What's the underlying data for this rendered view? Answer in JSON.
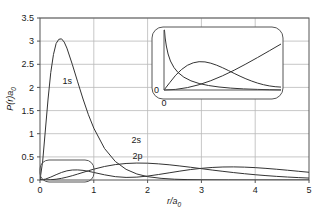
{
  "chart_data": {
    "type": "line",
    "title": "",
    "subtitle": "",
    "xlabel": "r/a",
    "xlabel_sub": "0",
    "ylabel": "P(r)a",
    "ylabel_sub": "0",
    "xlim": [
      0,
      5
    ],
    "ylim": [
      0,
      3.5
    ],
    "grid": true,
    "legend_position": "inline-annotations",
    "xticks": [
      "0",
      "1",
      "2",
      "3",
      "4",
      "5"
    ],
    "xtick_values": [
      0,
      1,
      2,
      3,
      4,
      5
    ],
    "yticks": [
      "0",
      "0.5",
      "1",
      "1.5",
      "2",
      "2.5",
      "3",
      "3.5"
    ],
    "ytick_values": [
      0,
      0.5,
      1,
      1.5,
      2,
      2.5,
      3,
      3.5
    ],
    "series": [
      {
        "name": "1s",
        "label": "1s",
        "label_x": 0.42,
        "label_y": 2.08,
        "peak_x": 0.4,
        "peak_y": 3.05,
        "points": [
          [
            0.0,
            0.0
          ],
          [
            0.05,
            0.41
          ],
          [
            0.1,
            1.08
          ],
          [
            0.15,
            1.75
          ],
          [
            0.2,
            2.32
          ],
          [
            0.25,
            2.71
          ],
          [
            0.3,
            2.95
          ],
          [
            0.35,
            3.04
          ],
          [
            0.4,
            3.05
          ],
          [
            0.45,
            2.98
          ],
          [
            0.5,
            2.85
          ],
          [
            0.6,
            2.5
          ],
          [
            0.7,
            2.12
          ],
          [
            0.8,
            1.75
          ],
          [
            0.9,
            1.41
          ],
          [
            1.0,
            1.12
          ],
          [
            1.2,
            0.68
          ],
          [
            1.4,
            0.4
          ],
          [
            1.6,
            0.23
          ],
          [
            1.8,
            0.13
          ],
          [
            2.0,
            0.072
          ],
          [
            2.25,
            0.036
          ],
          [
            2.5,
            0.017
          ],
          [
            2.75,
            0.008
          ],
          [
            3.0,
            0.004
          ],
          [
            3.5,
            0.0008
          ],
          [
            4.0,
            0.0001
          ],
          [
            5.0,
            0.0
          ]
        ]
      },
      {
        "name": "2s",
        "label": "2s",
        "label_x": 1.7,
        "label_y": 0.8,
        "peak_x": 2.05,
        "peak_y": 0.62,
        "points": [
          [
            0.0,
            0.0
          ],
          [
            0.1,
            0.019
          ],
          [
            0.2,
            0.063
          ],
          [
            0.3,
            0.115
          ],
          [
            0.4,
            0.163
          ],
          [
            0.5,
            0.198
          ],
          [
            0.6,
            0.216
          ],
          [
            0.7,
            0.218
          ],
          [
            0.8,
            0.208
          ],
          [
            0.9,
            0.188
          ],
          [
            1.0,
            0.163
          ],
          [
            1.2,
            0.112
          ],
          [
            1.4,
            0.072
          ],
          [
            1.6,
            0.056
          ],
          [
            1.8,
            0.062
          ],
          [
            2.0,
            0.085
          ],
          [
            2.2,
            0.118
          ],
          [
            2.4,
            0.155
          ],
          [
            2.6,
            0.192
          ],
          [
            2.8,
            0.226
          ],
          [
            3.0,
            0.252
          ],
          [
            3.2,
            0.271
          ],
          [
            3.4,
            0.281
          ],
          [
            3.6,
            0.283
          ],
          [
            3.8,
            0.278
          ],
          [
            4.0,
            0.267
          ],
          [
            4.2,
            0.251
          ],
          [
            4.4,
            0.232
          ],
          [
            4.6,
            0.211
          ],
          [
            4.8,
            0.189
          ],
          [
            5.0,
            0.167
          ]
        ]
      },
      {
        "name": "2p",
        "label": "2p",
        "label_x": 1.72,
        "label_y": 0.46,
        "peak_x": 1.95,
        "peak_y": 0.55,
        "points": [
          [
            0.0,
            0.0
          ],
          [
            0.1,
            0.0008
          ],
          [
            0.2,
            0.0056
          ],
          [
            0.3,
            0.017
          ],
          [
            0.4,
            0.036
          ],
          [
            0.5,
            0.062
          ],
          [
            0.6,
            0.093
          ],
          [
            0.7,
            0.128
          ],
          [
            0.8,
            0.164
          ],
          [
            0.9,
            0.2
          ],
          [
            1.0,
            0.234
          ],
          [
            1.2,
            0.292
          ],
          [
            1.4,
            0.333
          ],
          [
            1.6,
            0.357
          ],
          [
            1.8,
            0.366
          ],
          [
            2.0,
            0.363
          ],
          [
            2.2,
            0.349
          ],
          [
            2.4,
            0.329
          ],
          [
            2.6,
            0.303
          ],
          [
            2.8,
            0.275
          ],
          [
            3.0,
            0.245
          ],
          [
            3.2,
            0.215
          ],
          [
            3.4,
            0.187
          ],
          [
            3.6,
            0.16
          ],
          [
            3.8,
            0.136
          ],
          [
            4.0,
            0.114
          ],
          [
            4.2,
            0.095
          ],
          [
            4.4,
            0.078
          ],
          [
            4.6,
            0.064
          ],
          [
            4.8,
            0.052
          ],
          [
            5.0,
            0.042
          ]
        ]
      }
    ],
    "inset": {
      "xlim": [
        0,
        1
      ],
      "ylim": [
        0,
        0.6
      ],
      "x_origin_label": "0",
      "y_origin_label": "0",
      "description": "magnified view of the small-r region bounded by the rounded box near the origin",
      "series": [
        {
          "name": "1s",
          "points": [
            [
              0.0,
              0.6
            ],
            [
              0.004,
              0.6
            ],
            [
              0.01,
              0.52
            ],
            [
              0.02,
              0.44
            ],
            [
              0.035,
              0.36
            ],
            [
              0.055,
              0.29
            ],
            [
              0.085,
              0.225
            ],
            [
              0.12,
              0.175
            ],
            [
              0.17,
              0.128
            ],
            [
              0.23,
              0.092
            ],
            [
              0.3,
              0.065
            ],
            [
              0.38,
              0.045
            ],
            [
              0.47,
              0.03
            ],
            [
              0.57,
              0.019
            ],
            [
              0.68,
              0.011
            ],
            [
              0.8,
              0.006
            ],
            [
              0.9,
              0.003
            ],
            [
              1.0,
              0.001
            ]
          ]
        },
        {
          "name": "2s",
          "points": [
            [
              0.0,
              0.0
            ],
            [
              0.05,
              0.075
            ],
            [
              0.1,
              0.148
            ],
            [
              0.15,
              0.205
            ],
            [
              0.2,
              0.247
            ],
            [
              0.25,
              0.272
            ],
            [
              0.3,
              0.283
            ],
            [
              0.35,
              0.281
            ],
            [
              0.4,
              0.268
            ],
            [
              0.45,
              0.248
            ],
            [
              0.5,
              0.223
            ],
            [
              0.55,
              0.195
            ],
            [
              0.6,
              0.166
            ],
            [
              0.65,
              0.138
            ],
            [
              0.7,
              0.112
            ],
            [
              0.75,
              0.089
            ],
            [
              0.8,
              0.069
            ],
            [
              0.85,
              0.053
            ],
            [
              0.9,
              0.041
            ],
            [
              0.95,
              0.033
            ],
            [
              1.0,
              0.029
            ]
          ]
        },
        {
          "name": "2p",
          "points": [
            [
              0.0,
              0.0
            ],
            [
              0.1,
              0.006
            ],
            [
              0.2,
              0.024
            ],
            [
              0.3,
              0.053
            ],
            [
              0.4,
              0.093
            ],
            [
              0.5,
              0.142
            ],
            [
              0.6,
              0.198
            ],
            [
              0.7,
              0.26
            ],
            [
              0.8,
              0.325
            ],
            [
              0.9,
              0.392
            ],
            [
              1.0,
              0.46
            ]
          ]
        }
      ]
    },
    "colors": {
      "curve": "#333333",
      "grid": "#b9b9b9",
      "frame": "#555555",
      "text": "#1a1a1a",
      "background": "#ffffff"
    }
  }
}
